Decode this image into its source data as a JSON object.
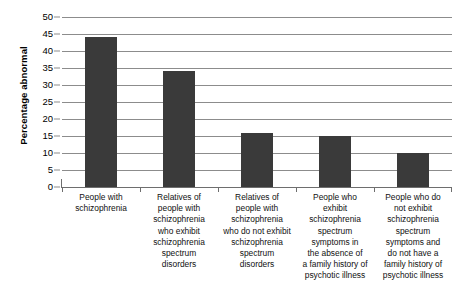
{
  "chart_data": {
    "type": "bar",
    "title": "",
    "xlabel": "",
    "ylabel": "Percentage abnormal",
    "ylim": [
      0,
      50
    ],
    "ytick_step": 5,
    "grid": true,
    "legend": "none",
    "bar_color": "#3a3a3a",
    "gridline_color": "#8c8c8c",
    "yticks": [
      "50",
      "45",
      "40",
      "35",
      "30",
      "25",
      "20",
      "15",
      "10",
      "5",
      "0"
    ],
    "categories": [
      "People with schizophrenia",
      "Relatives of people with schizophrenia who exhibit schizophrenia spectrum disorders",
      "Relatives of people with schizophrenia who do not exhibit schizophrenia spectrum disorders",
      "People who exhibit schizophrenia spectrum symptoms in the absence of a family history of psychotic illness",
      "People who do not exhibit schizophrenia spectrum symptoms and do not have a family history of psychotic illness"
    ],
    "category_lines": [
      [
        "People with",
        "schizophrenia"
      ],
      [
        "Relatives of",
        "people with",
        "schizophrenia",
        "who exhibit",
        "schizophrenia",
        "spectrum",
        "disorders"
      ],
      [
        "Relatives of",
        "people with",
        "schizophrenia",
        "who do not exhibit",
        "schizophrenia",
        "spectrum",
        "disorders"
      ],
      [
        "People who",
        "exhibit",
        "schizophrenia",
        "spectrum",
        "symptoms in",
        "the absence of",
        "a family history of",
        "psychotic illness"
      ],
      [
        "People who do",
        "not exhibit",
        "schizophrenia",
        "spectrum",
        "symptoms and",
        "do not have a",
        "family history of",
        "psychotic illness"
      ]
    ],
    "values": [
      44,
      34,
      16,
      15,
      10
    ]
  }
}
